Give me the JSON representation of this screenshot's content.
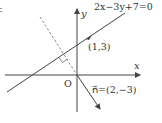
{
  "diagram": {
    "type": "coordinate-plane",
    "axes": {
      "x_label": "x",
      "y_label": "y",
      "origin_label": "O"
    },
    "line": {
      "equation": "2x−3y+7=0"
    },
    "point": {
      "label": "(1,3)"
    },
    "normal_vector": {
      "label": "n⃗=(2,−3)"
    },
    "colors": {
      "stroke": "#444444",
      "text": "#333333",
      "background": "#ffffff"
    }
  }
}
